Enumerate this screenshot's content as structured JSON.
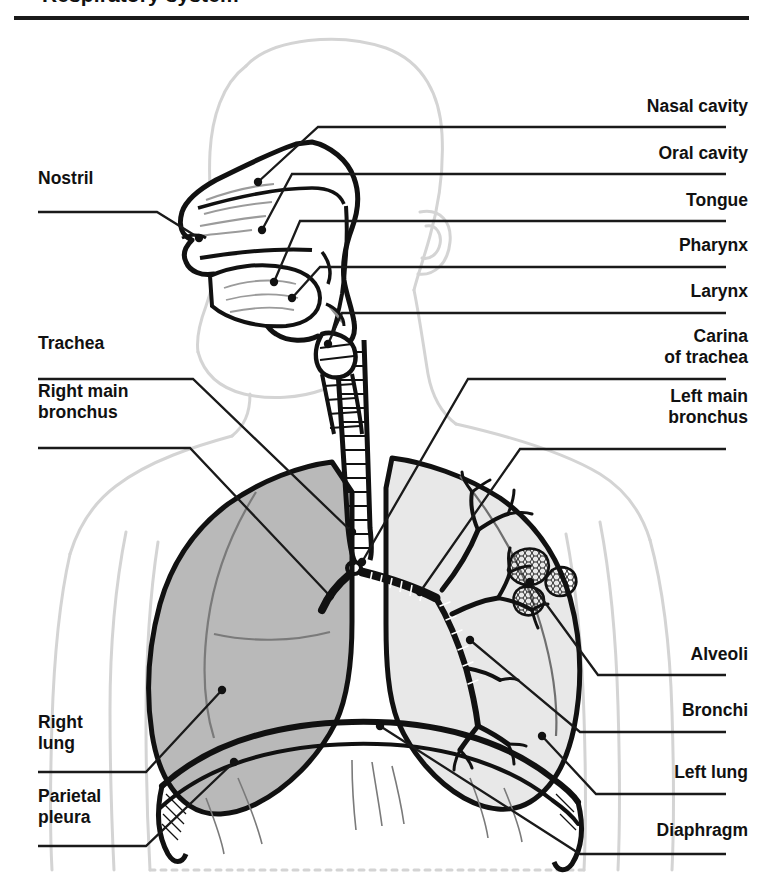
{
  "title": "Respiratory system",
  "colors": {
    "ink": "#111111",
    "body_outline": "#d4d4d4",
    "right_lung_fill": "#b9b9b9",
    "left_lung_fill": "#e8e8e8",
    "leader_line": "#1a1a1a",
    "background": "#ffffff"
  },
  "figure": {
    "alt": "Anterior view of the human respiratory system shown within a faint body outline, with a sagittal section of the head showing the nasal and oral cavities, tongue, pharynx and larynx, the segmented trachea dividing at the carina into the right and left main bronchi, the shaded right lung, the left lung containing the bronchial tree and alveoli, the diaphragm and the parietal pleura."
  },
  "labels": {
    "left": [
      {
        "id": "nostril",
        "text": "Nostril",
        "x": 38,
        "y": 168
      },
      {
        "id": "trachea",
        "text": "Trachea",
        "x": 38,
        "y": 333
      },
      {
        "id": "right-main-bronchus",
        "text": "Right main\nbronchus",
        "x": 38,
        "y": 381
      },
      {
        "id": "right-lung",
        "text": "Right\nlung",
        "x": 38,
        "y": 712
      },
      {
        "id": "parietal-pleura",
        "text": "Parietal\npleura",
        "x": 38,
        "y": 786
      }
    ],
    "right": [
      {
        "id": "nasal-cavity",
        "text": "Nasal cavity",
        "x": 748,
        "y": 96
      },
      {
        "id": "oral-cavity",
        "text": "Oral cavity",
        "x": 748,
        "y": 143
      },
      {
        "id": "tongue",
        "text": "Tongue",
        "x": 748,
        "y": 190
      },
      {
        "id": "pharynx",
        "text": "Pharynx",
        "x": 748,
        "y": 235
      },
      {
        "id": "larynx",
        "text": "Larynx",
        "x": 748,
        "y": 281
      },
      {
        "id": "carina-of-trachea",
        "text": "Carina\nof trachea",
        "x": 748,
        "y": 333
      },
      {
        "id": "left-main-bronchus",
        "text": "Left main\nbronchus",
        "x": 748,
        "y": 393
      },
      {
        "id": "alveoli",
        "text": "Alveoli",
        "x": 748,
        "y": 644
      },
      {
        "id": "bronchi",
        "text": "Bronchi",
        "x": 748,
        "y": 700
      },
      {
        "id": "left-lung",
        "text": "Left lung",
        "x": 748,
        "y": 762
      },
      {
        "id": "diaphragm",
        "text": "Diaphragm",
        "x": 748,
        "y": 820
      }
    ]
  }
}
